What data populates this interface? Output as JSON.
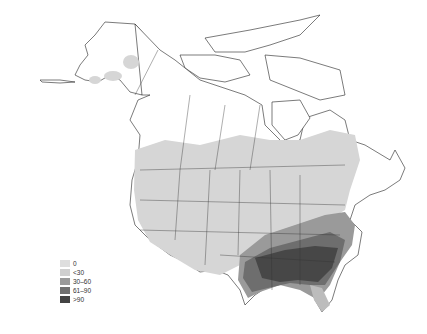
{
  "map": {
    "region": "North America",
    "projection": "Lambert conformal (grayscale choropleth)",
    "background": "#ffffff",
    "boundary_color": "#222222"
  },
  "legend": {
    "items": [
      {
        "label": "0",
        "color": "#dedede"
      },
      {
        "label": "<30",
        "color": "#cfcfcf"
      },
      {
        "label": "30–60",
        "color": "#9a9a9a"
      },
      {
        "label": "61–90",
        "color": "#707070"
      },
      {
        "label": ">90",
        "color": "#444444"
      }
    ]
  }
}
